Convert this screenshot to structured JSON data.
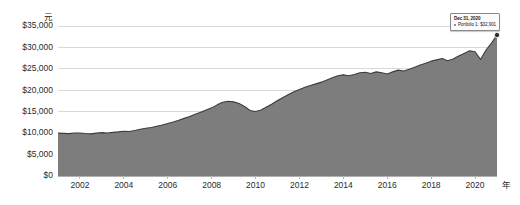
{
  "chart_data": {
    "type": "area",
    "title": "",
    "xlabel": "年",
    "ylabel": "元",
    "ylim": [
      0,
      35000
    ],
    "xlim": [
      2001.0,
      2021.0
    ],
    "grid": true,
    "legend_position": "none",
    "ytick_labels": [
      "$35,000",
      "$30,000",
      "$25,000",
      "$20,000",
      "$15,000",
      "$10,000",
      "$5,000",
      "$0"
    ],
    "ytick_values": [
      35000,
      30000,
      25000,
      20000,
      15000,
      10000,
      5000,
      0
    ],
    "xtick_labels": [
      "2002",
      "2004",
      "2006",
      "2008",
      "2010",
      "2012",
      "2014",
      "2016",
      "2018",
      "2020"
    ],
    "xtick_values": [
      2002,
      2004,
      2006,
      2008,
      2010,
      2012,
      2014,
      2016,
      2018,
      2020
    ],
    "series": [
      {
        "name": "Portfolio 1",
        "color": "#7d7d7d",
        "x": [
          2001.0,
          2001.25,
          2001.5,
          2001.75,
          2002.0,
          2002.25,
          2002.5,
          2002.75,
          2003.0,
          2003.25,
          2003.5,
          2003.75,
          2004.0,
          2004.25,
          2004.5,
          2004.75,
          2005.0,
          2005.25,
          2005.5,
          2005.75,
          2006.0,
          2006.25,
          2006.5,
          2006.75,
          2007.0,
          2007.25,
          2007.5,
          2007.75,
          2008.0,
          2008.25,
          2008.5,
          2008.75,
          2009.0,
          2009.25,
          2009.5,
          2009.75,
          2010.0,
          2010.25,
          2010.5,
          2010.75,
          2011.0,
          2011.25,
          2011.5,
          2011.75,
          2012.0,
          2012.25,
          2012.5,
          2012.75,
          2013.0,
          2013.25,
          2013.5,
          2013.75,
          2014.0,
          2014.25,
          2014.5,
          2014.75,
          2015.0,
          2015.25,
          2015.5,
          2015.75,
          2016.0,
          2016.25,
          2016.5,
          2016.75,
          2017.0,
          2017.25,
          2017.5,
          2017.75,
          2018.0,
          2018.25,
          2018.5,
          2018.75,
          2019.0,
          2019.25,
          2019.5,
          2019.75,
          2020.0,
          2020.25,
          2020.5,
          2020.75,
          2021.0
        ],
        "values": [
          10000,
          9950,
          9880,
          10020,
          10050,
          9900,
          9820,
          10000,
          10120,
          10050,
          10180,
          10300,
          10450,
          10400,
          10600,
          10900,
          11150,
          11300,
          11600,
          11900,
          12250,
          12600,
          13000,
          13450,
          13900,
          14400,
          14900,
          15400,
          15900,
          16600,
          17200,
          17450,
          17300,
          16900,
          16200,
          15300,
          15050,
          15400,
          16100,
          16800,
          17600,
          18300,
          19000,
          19650,
          20200,
          20700,
          21100,
          21500,
          21900,
          22400,
          22900,
          23400,
          23600,
          23400,
          23700,
          24100,
          24200,
          23900,
          24300,
          24100,
          23800,
          24300,
          24700,
          24500,
          24900,
          25400,
          25900,
          26300,
          26800,
          27100,
          27400,
          26900,
          27300,
          28000,
          28600,
          29200,
          29000,
          27200,
          29400,
          31000,
          32901
        ]
      }
    ],
    "annotations": [
      {
        "name": "endpoint-tooltip",
        "date_label": "Dec 31, 2020",
        "series_label": "Portfolio 1:",
        "value_label": "$32,901",
        "at_x": 2021.0,
        "at_y": 32901
      }
    ]
  }
}
